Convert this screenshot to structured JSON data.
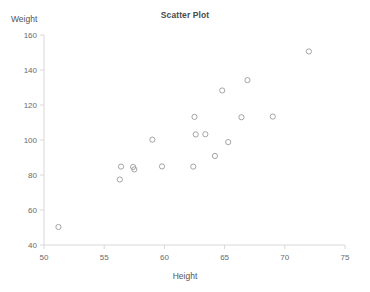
{
  "chart_data": {
    "type": "scatter",
    "title": "Scatter Plot",
    "xlabel": "Height",
    "ylabel": "Weight",
    "xlim": [
      50,
      75
    ],
    "ylim": [
      40,
      160
    ],
    "xticks": [
      50,
      55,
      60,
      65,
      70,
      75
    ],
    "yticks": [
      40,
      60,
      80,
      100,
      120,
      140,
      160
    ],
    "grid": false,
    "legend": null,
    "marker": "open-circle",
    "marker_color": "#9a9a9a",
    "axis_color": "#d8d8d8",
    "points": [
      {
        "x": 51.2,
        "y": 50.3
      },
      {
        "x": 56.3,
        "y": 77.4
      },
      {
        "x": 56.4,
        "y": 84.8
      },
      {
        "x": 57.4,
        "y": 84.6
      },
      {
        "x": 57.5,
        "y": 83.2
      },
      {
        "x": 59.0,
        "y": 100.2
      },
      {
        "x": 59.8,
        "y": 84.9
      },
      {
        "x": 62.4,
        "y": 84.8
      },
      {
        "x": 62.5,
        "y": 113.2
      },
      {
        "x": 62.6,
        "y": 103.2
      },
      {
        "x": 63.4,
        "y": 103.3
      },
      {
        "x": 64.2,
        "y": 90.9
      },
      {
        "x": 64.8,
        "y": 128.3
      },
      {
        "x": 65.3,
        "y": 98.8
      },
      {
        "x": 66.4,
        "y": 113.0
      },
      {
        "x": 66.9,
        "y": 134.2
      },
      {
        "x": 69.0,
        "y": 113.4
      },
      {
        "x": 72.0,
        "y": 150.6
      }
    ]
  }
}
